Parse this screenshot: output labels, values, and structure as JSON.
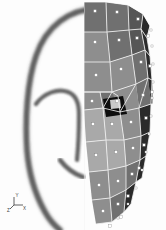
{
  "figure": {
    "type": "technical-illustration",
    "width": 166,
    "height": 230,
    "background_color": "#fdfdfd"
  },
  "photo": {
    "name": "ear-photograph",
    "description": "Grayscale profile photograph of a human outer ear (pinna)",
    "ink_color": "#4a4a4a",
    "helix_outline": "M 96 9 C 70 9 46 26 36 56 C 27 82 25 120 27 150 C 29 176 36 196 45 212 C 50 221 55 226 60 230",
    "antihelix_outline": "M 36 104 C 44 93 58 88 68 92 C 76 95 79 103 79 114 C 79 132 78 150 77 160",
    "lobe_outline": "M 60 160 C 66 168 74 174 83 177",
    "top_guide_line": "M 2 11 L 86 11"
  },
  "axis_indicator": {
    "name": "coordinate-axis-triad",
    "x": 14,
    "y": 205,
    "labels": [
      "Y",
      "X",
      "Z"
    ],
    "color": "#3a3a3a"
  },
  "mesh": {
    "name": "finite-element-surface-mesh",
    "left_clip_x": 84,
    "edge_color": "#f2f2f2",
    "node_color": "#ffffff",
    "node_edge_color": "#7a7a7a",
    "node_size": 2.6,
    "shading": {
      "light_face": "#a9a9a9",
      "mid_face": "#8e8e8e",
      "dark_face": "#6f6f6f",
      "darker_face": "#565656",
      "rim_face": "#2c2c2c",
      "canal_black": "#0a0a0a",
      "canal_highlight": "#c9c9c9"
    },
    "faces": [
      {
        "id": "f01",
        "shade": "dark_face",
        "points": "84,2 106,2 107,32 84,32"
      },
      {
        "id": "f02",
        "shade": "dark_face",
        "points": "106,2 128,5 129,30 107,32"
      },
      {
        "id": "f03",
        "shade": "darker_face",
        "points": "128,5 143,14 141,29 129,30"
      },
      {
        "id": "f04",
        "shade": "rim_face",
        "points": "143,14 150,26 147,38 141,29"
      },
      {
        "id": "f05",
        "shade": "mid_face",
        "points": "84,32 107,32 110,62 84,62"
      },
      {
        "id": "f06",
        "shade": "dark_face",
        "points": "107,32 129,30 132,55 110,62"
      },
      {
        "id": "f07",
        "shade": "darker_face",
        "points": "129,30 141,29 145,50 132,55"
      },
      {
        "id": "f08",
        "shade": "rim_face",
        "points": "141,29 147,38 150,56 145,50"
      },
      {
        "id": "f09",
        "shade": "mid_face",
        "points": "84,62 110,62 112,92 84,92"
      },
      {
        "id": "f10",
        "shade": "mid_face",
        "points": "110,62 132,55 136,84 112,92"
      },
      {
        "id": "f11",
        "shade": "dark_face",
        "points": "132,55 145,50 148,78 136,84"
      },
      {
        "id": "f12",
        "shade": "rim_face",
        "points": "145,50 150,56 152,80 148,78"
      },
      {
        "id": "f13",
        "shade": "mid_face",
        "points": "84,92 100,92 103,108 84,110"
      },
      {
        "id": "f14",
        "shade": "dark_face",
        "points": "100,92 112,92 118,96 120,112 103,108"
      },
      {
        "id": "f15",
        "shade": "mid_face",
        "points": "112,92 136,84 139,108 120,112"
      },
      {
        "id": "f16",
        "shade": "dark_face",
        "points": "136,84 148,78 151,104 139,108"
      },
      {
        "id": "f17",
        "shade": "rim_face",
        "points": "148,78 152,80 153,104 151,104"
      },
      {
        "id": "f18",
        "shade": "light_face",
        "points": "84,110 103,108 106,140 86,142"
      },
      {
        "id": "f19",
        "shade": "light_face",
        "points": "103,108 120,112 124,140 106,140"
      },
      {
        "id": "f20",
        "shade": "mid_face",
        "points": "120,112 139,108 141,136 124,140"
      },
      {
        "id": "f21",
        "shade": "rim_face",
        "points": "139,108 151,104 150,132 141,136"
      },
      {
        "id": "f22",
        "shade": "light_face",
        "points": "86,142 106,140 108,170 89,172"
      },
      {
        "id": "f23",
        "shade": "light_face",
        "points": "106,140 124,140 126,166 108,170"
      },
      {
        "id": "f24",
        "shade": "mid_face",
        "points": "124,140 141,136 140,160 126,166"
      },
      {
        "id": "f25",
        "shade": "rim_face",
        "points": "141,136 150,132 146,156 140,160"
      },
      {
        "id": "f26",
        "shade": "mid_face",
        "points": "89,172 108,170 110,198 92,200"
      },
      {
        "id": "f27",
        "shade": "mid_face",
        "points": "108,170 126,166 126,190 110,198"
      },
      {
        "id": "f28",
        "shade": "dark_face",
        "points": "126,166 140,160 136,182 126,190"
      },
      {
        "id": "f29",
        "shade": "rim_face",
        "points": "140,160 146,156 142,178 136,182"
      },
      {
        "id": "f30",
        "shade": "mid_face",
        "points": "92,200 110,198 112,222 96,224"
      },
      {
        "id": "f31",
        "shade": "dark_face",
        "points": "110,198 126,190 124,212 112,222"
      },
      {
        "id": "f32",
        "shade": "rim_face",
        "points": "126,190 136,182 131,204 124,212"
      }
    ],
    "canal": {
      "name": "ear-canal-opening",
      "outer": "103,99 123,96 127,114 106,117",
      "highlight": "110,100 120,99 121,108 111,109"
    },
    "edges": [
      "M 84 2 L 84 230",
      "M 84 32 L 107 32 L 129 30 L 141 29 L 147 38 L 150 26",
      "M 84 62 L 110 62 L 132 55 L 145 50 L 150 56",
      "M 84 92 L 112 92 L 136 84 L 148 78 L 152 80",
      "M 84 110 L 103 108 L 120 112 L 139 108 L 151 104 L 153 104",
      "M 86 142 L 106 140 L 124 140 L 141 136 L 150 132",
      "M 89 172 L 108 170 L 126 166 L 140 160 L 146 156",
      "M 92 200 L 110 198 L 126 190 L 136 182 L 142 178",
      "M 96 224 L 112 222 L 124 212 L 131 204",
      "M 106 2 L 107 32 L 110 62 L 112 92 L 103 108 L 106 140 L 108 170 L 110 198 L 112 222",
      "M 128 5 L 129 30 L 132 55 L 136 84 L 120 112 L 124 140 L 126 166 L 126 190 L 124 212",
      "M 143 14 L 141 29 L 145 50 L 148 78 L 139 108 L 141 136 L 140 160 L 136 182 L 131 204",
      "M 150 26 L 147 38 L 150 56 L 152 80 L 151 104 L 150 132 L 146 156 L 142 178",
      "M 84 2 L 106 2 L 128 5 L 143 14 L 150 26",
      "M 100 92 L 103 108",
      "M 112 92 L 118 96 L 120 112",
      "M 84 92 L 100 92 L 112 92"
    ],
    "outline": "M 84 2 L 106 2 L 128 5 L 143 14 L 150 26 L 152 52 L 153 86 L 152 112 L 150 140 L 146 166 L 140 190 L 131 208 L 120 222 L 108 228 L 96 229 L 84 230 Z",
    "nodes": [
      [
        95,
        11
      ],
      [
        117,
        12
      ],
      [
        138,
        19
      ],
      [
        95,
        42
      ],
      [
        119,
        40
      ],
      [
        137,
        38
      ],
      [
        148,
        36
      ],
      [
        96,
        75
      ],
      [
        121,
        69
      ],
      [
        141,
        62
      ],
      [
        150,
        66
      ],
      [
        92,
        101
      ],
      [
        117,
        101
      ],
      [
        143,
        95
      ],
      [
        152,
        92
      ],
      [
        93,
        124
      ],
      [
        112,
        124
      ],
      [
        131,
        122
      ],
      [
        146,
        118
      ],
      [
        96,
        155
      ],
      [
        116,
        152
      ],
      [
        133,
        148
      ],
      [
        144,
        145
      ],
      [
        99,
        185
      ],
      [
        118,
        181
      ],
      [
        132,
        174
      ],
      [
        139,
        168
      ],
      [
        103,
        211
      ],
      [
        118,
        204
      ],
      [
        128,
        196
      ],
      [
        110,
        226
      ],
      [
        121,
        217
      ]
    ],
    "rim_nodes": [
      [
        151,
        30
      ],
      [
        152,
        46
      ],
      [
        153,
        64
      ],
      [
        153,
        82
      ],
      [
        152,
        98
      ],
      [
        151,
        116
      ],
      [
        149,
        134
      ],
      [
        146,
        152
      ],
      [
        142,
        170
      ],
      [
        136,
        188
      ],
      [
        128,
        204
      ],
      [
        118,
        218
      ]
    ]
  }
}
